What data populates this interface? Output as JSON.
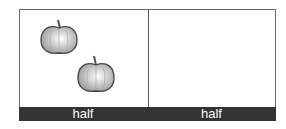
{
  "panels": [
    {
      "label": "half",
      "items": [
        {
          "type": "apple-icon"
        },
        {
          "type": "apple-icon"
        }
      ]
    },
    {
      "label": "half",
      "items": []
    }
  ],
  "colors": {
    "border": "#666666",
    "bar": "#333333",
    "label_text": "#ffffff"
  }
}
